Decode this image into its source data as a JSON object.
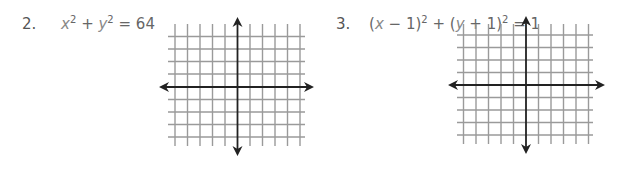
{
  "problems": [
    {
      "number": "2.",
      "equation_parts": {
        "a": "x",
        "b": "2",
        "c": " + ",
        "d": "y",
        "e": "2",
        "f": " = 64"
      },
      "graph": {
        "x_lines": [
          175,
          187.5,
          200,
          212.5,
          225,
          250,
          262.5,
          275,
          287.5,
          300
        ],
        "y_lines": [
          36.5,
          49,
          61.5,
          74,
          99.5,
          112,
          124.5,
          137
        ],
        "grid_left": 168,
        "grid_right": 305,
        "grid_top": 24,
        "grid_bottom": 146,
        "axis_x": 237.5,
        "axis_y": 87,
        "arrow_left": 159,
        "arrow_right": 314,
        "arrow_top": 17,
        "arrow_bottom": 156
      }
    },
    {
      "number": "3.",
      "equation_parts": {
        "a": "(",
        "b": "x",
        "c": " − 1)",
        "d": "2",
        "e": " + (",
        "f": "y",
        "g": " + 1)",
        "h": "2",
        "i": " = 1"
      },
      "graph": {
        "x_lines": [
          463.5,
          476,
          488.5,
          501,
          513.5,
          538.5,
          551,
          563.5,
          576,
          588.5
        ],
        "y_lines": [
          35,
          47.5,
          60,
          72.5,
          97.5,
          110,
          122.5,
          135
        ],
        "grid_left": 457,
        "grid_right": 593,
        "grid_top": 24,
        "grid_bottom": 144,
        "axis_x": 526,
        "axis_y": 85,
        "arrow_left": 448,
        "arrow_right": 605,
        "arrow_top": 16,
        "arrow_bottom": 154
      }
    }
  ],
  "colors": {
    "grid": "#9a9a9a",
    "axis": "#222222"
  }
}
